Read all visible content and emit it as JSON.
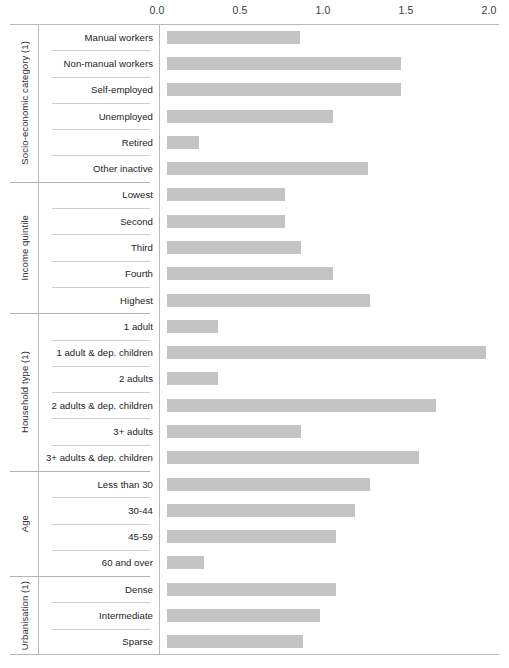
{
  "chart_data": {
    "type": "bar",
    "orientation": "horizontal",
    "title": "",
    "xlabel": "",
    "ylabel": "",
    "xlim": [
      0.0,
      2.0
    ],
    "grid": false,
    "legend": null,
    "bar_color": "#c3c3c3",
    "axis_ticks": [
      "0.0",
      "0.5",
      "1.0",
      "1.5",
      "2.0"
    ],
    "axis_tick_values": [
      0.0,
      0.5,
      1.0,
      1.5,
      2.0
    ],
    "groups": [
      {
        "name": "Socio-economic category (1)",
        "categories": [
          "Manual workers",
          "Non-manual workers",
          "Self-employed",
          "Unemployed",
          "Retired",
          "Other inactive"
        ],
        "values": [
          0.8,
          1.41,
          1.41,
          1.0,
          0.19,
          1.21
        ]
      },
      {
        "name": "Income quintile",
        "categories": [
          "Lowest",
          "Second",
          "Third",
          "Fourth",
          "Highest"
        ],
        "values": [
          0.71,
          0.71,
          0.81,
          1.0,
          1.22
        ]
      },
      {
        "name": "Household type (1)",
        "categories": [
          "1 adult",
          "1 adult & dep. children",
          "2 adults",
          "2 adults & dep. children",
          "3+ adults",
          "3+ adults & dep. children"
        ],
        "values": [
          0.31,
          1.92,
          0.31,
          1.62,
          0.81,
          1.52
        ]
      },
      {
        "name": "Age",
        "categories": [
          "Less than 30",
          "30-44",
          "45-59",
          "60 and over"
        ],
        "values": [
          1.22,
          1.13,
          1.02,
          0.22
        ]
      },
      {
        "name": "Urbanisation (1)",
        "categories": [
          "Dense",
          "Intermediate",
          "Sparse"
        ],
        "values": [
          1.02,
          0.92,
          0.82
        ]
      }
    ]
  }
}
